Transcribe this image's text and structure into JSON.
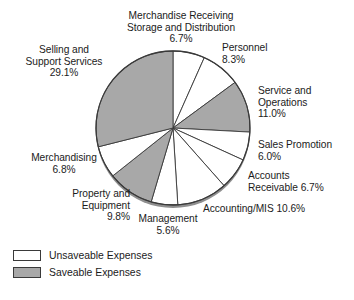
{
  "chart_data": {
    "type": "pie",
    "title": "",
    "categories": [
      "Merchandise Receiving Storage and Distribution",
      "Personnel",
      "Service and Operations",
      "Sales Promotion",
      "Accounts Receivable",
      "Accounting/MIS",
      "Management",
      "Property and Equipment",
      "Merchandising",
      "Selling and Support Services"
    ],
    "values": [
      6.7,
      8.3,
      11.0,
      6.0,
      6.7,
      10.6,
      5.6,
      9.8,
      6.8,
      29.1
    ],
    "unit": "%",
    "start_angle_deg": 0,
    "direction": "clockwise",
    "legend_position": "bottom-left",
    "grid": false,
    "slices": [
      {
        "label": "Merchandise Receiving\nStorage and Distribution",
        "value_label": "6.7%",
        "value": 6.7,
        "group": "Unsaveable Expenses",
        "fill": "#ffffff"
      },
      {
        "label": "Personnel",
        "value_label": "8.3%",
        "value": 8.3,
        "group": "Unsaveable Expenses",
        "fill": "#ffffff"
      },
      {
        "label": "Service and\nOperations",
        "value_label": "11.0%",
        "value": 11.0,
        "group": "Saveable Expenses",
        "fill": "#a8a8a8"
      },
      {
        "label": "Sales Promotion",
        "value_label": "6.0%",
        "value": 6.0,
        "group": "Unsaveable Expenses",
        "fill": "#ffffff"
      },
      {
        "label": "Accounts",
        "value_label": "Receivable 6.7%",
        "value": 6.7,
        "group": "Unsaveable Expenses",
        "fill": "#ffffff"
      },
      {
        "label": "Accounting/MIS 10.6%",
        "value_label": "",
        "value": 10.6,
        "group": "Unsaveable Expenses",
        "fill": "#ffffff"
      },
      {
        "label": "Management",
        "value_label": "5.6%",
        "value": 5.6,
        "group": "Unsaveable Expenses",
        "fill": "#ffffff"
      },
      {
        "label": "Property and\nEquipment",
        "value_label": "9.8%",
        "value": 9.8,
        "group": "Saveable Expenses",
        "fill": "#a8a8a8"
      },
      {
        "label": "Merchandising",
        "value_label": "6.8%",
        "value": 6.8,
        "group": "Unsaveable Expenses",
        "fill": "#ffffff"
      },
      {
        "label": "Selling and\nSupport Services",
        "value_label": "29.1%",
        "value": 29.1,
        "group": "Saveable Expenses",
        "fill": "#a8a8a8"
      }
    ]
  },
  "labels": {
    "merchandise_receiving": "Merchandise Receiving\nStorage and Distribution\n6.7%",
    "personnel": "Personnel\n8.3%",
    "service_operations": "Service and\nOperations\n11.0%",
    "sales_promotion": "Sales Promotion\n6.0%",
    "accounts_receivable": "Accounts\nReceivable 6.7%",
    "accounting_mis": "Accounting/MIS 10.6%",
    "management": "Management\n5.6%",
    "property_equipment": "Property and\nEquipment\n9.8%",
    "merchandising": "Merchandising\n6.8%",
    "selling_support": "Selling and\nSupport Services\n29.1%"
  },
  "legend": {
    "items": [
      {
        "label": "Unsaveable Expenses",
        "color": "#ffffff"
      },
      {
        "label": "Saveable Expenses",
        "color": "#a8a8a8"
      }
    ]
  },
  "colors": {
    "saveable": "#a8a8a8",
    "unsaveable": "#ffffff",
    "outline": "#3a3a3a",
    "text": "#1b1b1b",
    "background": "#ffffff"
  }
}
